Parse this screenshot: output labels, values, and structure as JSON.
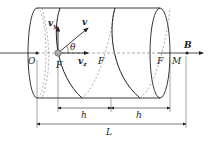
{
  "diagram": {
    "colors": {
      "line": "#222222",
      "dashed": "#888888",
      "particle": "#999999"
    },
    "labels": {
      "origin": "O",
      "focus1": "F",
      "focus2": "F",
      "focus3": "F",
      "point_m": "M",
      "field": "B",
      "velocity": "v",
      "velocity_y": "v",
      "velocity_y_sub": "y",
      "velocity_z": "v",
      "velocity_z_sub": "z",
      "angle": "θ",
      "pitch1": "h",
      "pitch2": "h",
      "length": "L"
    }
  }
}
